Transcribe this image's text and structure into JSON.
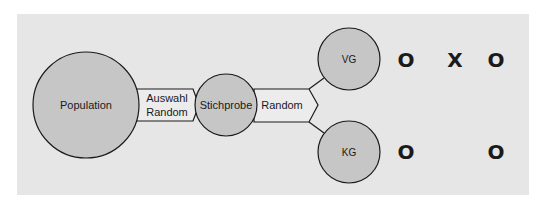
{
  "diagram": {
    "type": "experimental-design-flow",
    "colors": {
      "page_background": "#ffffff",
      "panel_background": "#e6e6e6",
      "circle_fill": "#c6c6c6",
      "arrow_fill": "#ececec",
      "stroke": "#1a1a1a"
    },
    "nodes": {
      "population": {
        "label": "Population"
      },
      "sample": {
        "label": "Stichprobe"
      },
      "treatment_group": {
        "label": "VG"
      },
      "control_group": {
        "label": "KG"
      }
    },
    "arrows": {
      "selection": {
        "line1": "Auswahl",
        "line2": "Random"
      },
      "assignment": {
        "label": "Random"
      }
    },
    "observation_rows": {
      "vg_row": [
        "O",
        "X",
        "O"
      ],
      "kg_row": [
        "O",
        "",
        "O"
      ]
    }
  }
}
